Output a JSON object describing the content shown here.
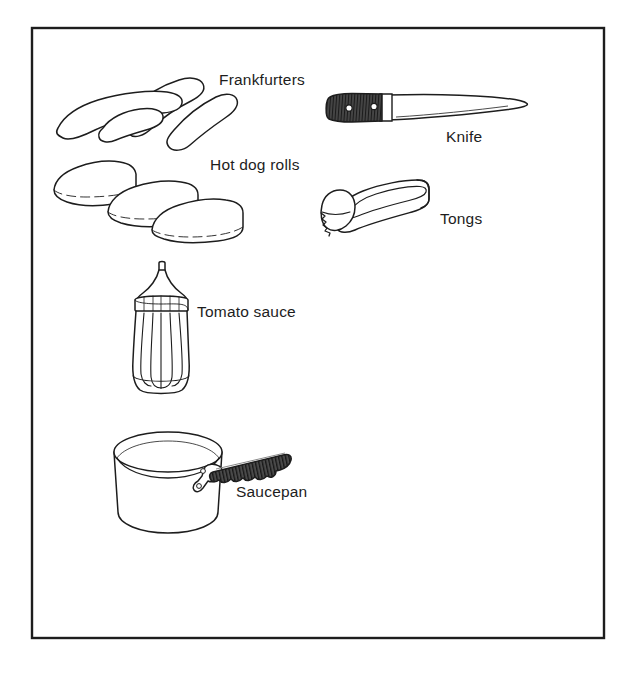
{
  "page": {
    "background_color": "#ffffff",
    "ink_color": "#1d1d1d",
    "frame": {
      "name": "illustration-border",
      "x": 32,
      "y": 28,
      "width": 572,
      "height": 610,
      "stroke_color": "#1d1d1d",
      "stroke_width": 2.2
    }
  },
  "labels": {
    "frankfurters": "Frankfurters",
    "hot_dog_rolls": "Hot dog rolls",
    "knife": "Knife",
    "tongs": "Tongs",
    "tomato_sauce": "Tomato sauce",
    "saucepan": "Saucepan"
  },
  "illustrations": [
    {
      "id": "frankfurters",
      "name": "frankfurters-illustration",
      "label": "Frankfurters",
      "description": "Three overlapping curved sausages drawn in outline",
      "count": 3,
      "fill": "#ffffff",
      "stroke": "#1d1d1d",
      "bounds": {
        "x": 50,
        "y": 78,
        "width": 166,
        "height": 66
      }
    },
    {
      "id": "hot_dog_rolls",
      "name": "hot-dog-rolls-illustration",
      "label": "Hot dog rolls",
      "description": "Three stacked oblong bread rolls with side slit lines",
      "count": 3,
      "fill": "#ffffff",
      "stroke": "#1d1d1d",
      "bounds": {
        "x": 50,
        "y": 160,
        "width": 178,
        "height": 80
      }
    },
    {
      "id": "knife",
      "name": "knife-illustration",
      "label": "Knife",
      "description": "Cook's knife with dark hatched wooden handle, two rivets and long tapering blade",
      "handle_fill": "#3a3a3a",
      "blade_fill": "#ffffff",
      "rivets": 2,
      "stroke": "#1d1d1d",
      "bounds": {
        "x": 324,
        "y": 88,
        "width": 204,
        "height": 42
      }
    },
    {
      "id": "tongs",
      "name": "tongs-illustration",
      "label": "Tongs",
      "description": "Serving tongs: long sprung loop with serrated scoop jaws at lower left",
      "fill": "#ffffff",
      "stroke": "#1d1d1d",
      "bounds": {
        "x": 318,
        "y": 182,
        "width": 112,
        "height": 58
      }
    },
    {
      "id": "tomato_sauce",
      "name": "tomato-sauce-bottle-illustration",
      "label": "Tomato sauce",
      "description": "Fluted squeeze sauce bottle with conical cap and banded neck collar",
      "flutes": 6,
      "fill": "#ffffff",
      "stroke": "#1d1d1d",
      "bounds": {
        "x": 130,
        "y": 262,
        "width": 66,
        "height": 134
      }
    },
    {
      "id": "saucepan",
      "name": "saucepan-illustration",
      "label": "Saucepan",
      "description": "Cylindrical saucepan seen in perspective with elliptical rim and dark ribbed handle with scalloped underside",
      "body_fill": "#ffffff",
      "handle_fill": "#3f3f3f",
      "stroke": "#1d1d1d",
      "bounds": {
        "x": 110,
        "y": 432,
        "width": 178,
        "height": 106
      }
    }
  ]
}
